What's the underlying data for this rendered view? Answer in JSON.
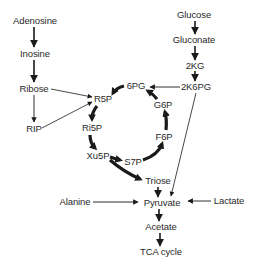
{
  "diagram": {
    "type": "metabolic-pathway",
    "nodes": [
      {
        "id": "adenosine",
        "label": "Adenosine",
        "x": 35,
        "y": 21
      },
      {
        "id": "inosine",
        "label": "Inosine",
        "x": 35,
        "y": 54
      },
      {
        "id": "ribose",
        "label": "Ribose",
        "x": 34,
        "y": 89
      },
      {
        "id": "rip",
        "label": "RIP",
        "x": 34,
        "y": 129
      },
      {
        "id": "r5p",
        "label": "R5P",
        "x": 103,
        "y": 99
      },
      {
        "id": "ri5p",
        "label": "Ri5P",
        "x": 92,
        "y": 128
      },
      {
        "id": "xu5p",
        "label": "Xu5P",
        "x": 98,
        "y": 156
      },
      {
        "id": "s7p",
        "label": "S7P",
        "x": 133,
        "y": 162
      },
      {
        "id": "triose",
        "label": "Triose",
        "x": 158,
        "y": 181
      },
      {
        "id": "6pg",
        "label": "6PG",
        "x": 136,
        "y": 86
      },
      {
        "id": "g6p",
        "label": "G6P",
        "x": 163,
        "y": 105
      },
      {
        "id": "f6p",
        "label": "F6P",
        "x": 164,
        "y": 137
      },
      {
        "id": "glucose",
        "label": "Glucose",
        "x": 194,
        "y": 15
      },
      {
        "id": "gluconate",
        "label": "Gluconate",
        "x": 194,
        "y": 40
      },
      {
        "id": "2kg",
        "label": "2KG",
        "x": 195,
        "y": 66
      },
      {
        "id": "2k6pg",
        "label": "2K6PG",
        "x": 196,
        "y": 87
      },
      {
        "id": "pyruvate",
        "label": "Pyruvate",
        "x": 161,
        "y": 203
      },
      {
        "id": "lactate",
        "label": "Lactate",
        "x": 229,
        "y": 201
      },
      {
        "id": "alanine",
        "label": "Alanine",
        "x": 75,
        "y": 202
      },
      {
        "id": "acetate",
        "label": "Acetate",
        "x": 161,
        "y": 227
      },
      {
        "id": "tca",
        "label": "TCA cycle",
        "x": 161,
        "y": 252
      }
    ],
    "edges": [
      {
        "from": "adenosine",
        "to": "inosine",
        "weight": "normal"
      },
      {
        "from": "inosine",
        "to": "ribose",
        "weight": "normal"
      },
      {
        "from": "ribose",
        "to": "rip",
        "weight": "thin"
      },
      {
        "from": "ribose",
        "to": "r5p",
        "weight": "thin"
      },
      {
        "from": "rip",
        "to": "r5p",
        "weight": "thin"
      },
      {
        "from": "glucose",
        "to": "gluconate",
        "weight": "normal"
      },
      {
        "from": "gluconate",
        "to": "2kg",
        "weight": "normal"
      },
      {
        "from": "2kg",
        "to": "2k6pg",
        "weight": "normal"
      },
      {
        "from": "2k6pg",
        "to": "6pg",
        "weight": "thin"
      },
      {
        "from": "2k6pg",
        "to": "pyruvate",
        "weight": "thin"
      },
      {
        "from": "6pg",
        "to": "r5p",
        "weight": "thick"
      },
      {
        "from": "r5p",
        "to": "ri5p",
        "weight": "thick"
      },
      {
        "from": "ri5p",
        "to": "xu5p",
        "weight": "thick"
      },
      {
        "from": "xu5p",
        "to": "s7p",
        "weight": "thick"
      },
      {
        "from": "xu5p",
        "to": "triose",
        "weight": "thick"
      },
      {
        "from": "s7p",
        "to": "f6p",
        "weight": "thick"
      },
      {
        "from": "f6p",
        "to": "g6p",
        "weight": "thick"
      },
      {
        "from": "g6p",
        "to": "6pg",
        "weight": "thick"
      },
      {
        "from": "triose",
        "to": "pyruvate",
        "weight": "normal"
      },
      {
        "from": "alanine",
        "to": "pyruvate",
        "weight": "thin"
      },
      {
        "from": "lactate",
        "to": "pyruvate",
        "weight": "thin"
      },
      {
        "from": "pyruvate",
        "to": "acetate",
        "weight": "normal"
      },
      {
        "from": "acetate",
        "to": "tca",
        "weight": "normal"
      }
    ],
    "colors": {
      "ink": "#1a1a1a",
      "text": "#2a2a2a",
      "background": "#ffffff"
    }
  }
}
